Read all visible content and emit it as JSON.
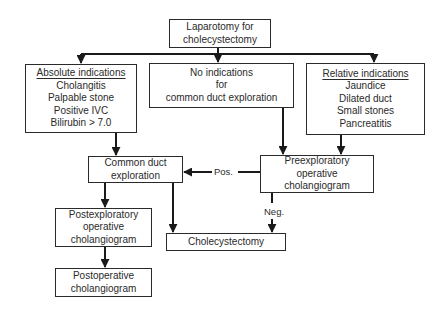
{
  "diagram": {
    "type": "flowchart",
    "nodes": {
      "start": {
        "lines": [
          "Laparotomy for",
          "cholecystectomy"
        ]
      },
      "absolute": {
        "header": "Absolute indications",
        "lines": [
          "Cholangitis",
          "Palpable stone",
          "Positive IVC",
          "Bilirubin > 7.0"
        ]
      },
      "none": {
        "lines": [
          "No indications",
          "for",
          "common duct exploration"
        ]
      },
      "relative": {
        "header": "Relative indications",
        "lines": [
          "Jaundice",
          "Dilated duct",
          "Small stones",
          "Pancreatitis"
        ]
      },
      "cde": {
        "lines": [
          "Common duct",
          "exploration"
        ]
      },
      "preexp": {
        "lines": [
          "Preexploratory",
          "operative",
          "cholangiogram"
        ]
      },
      "postexp": {
        "lines": [
          "Postexploratory",
          "operative",
          "cholangiogram"
        ]
      },
      "chole": {
        "lines": [
          "Cholecystectomy"
        ]
      },
      "postop": {
        "lines": [
          "Postoperative",
          "cholangiogram"
        ]
      }
    },
    "edge_labels": {
      "pos": "Pos.",
      "neg": "Neg."
    },
    "edges": [
      [
        "start",
        "absolute"
      ],
      [
        "start",
        "none"
      ],
      [
        "start",
        "relative"
      ],
      [
        "absolute",
        "cde"
      ],
      [
        "none",
        "preexp"
      ],
      [
        "relative",
        "preexp"
      ],
      [
        "preexp",
        "cde",
        "Pos."
      ],
      [
        "preexp",
        "chole",
        "Neg."
      ],
      [
        "cde",
        "postexp"
      ],
      [
        "cde",
        "chole"
      ],
      [
        "postexp",
        "postop"
      ]
    ]
  }
}
